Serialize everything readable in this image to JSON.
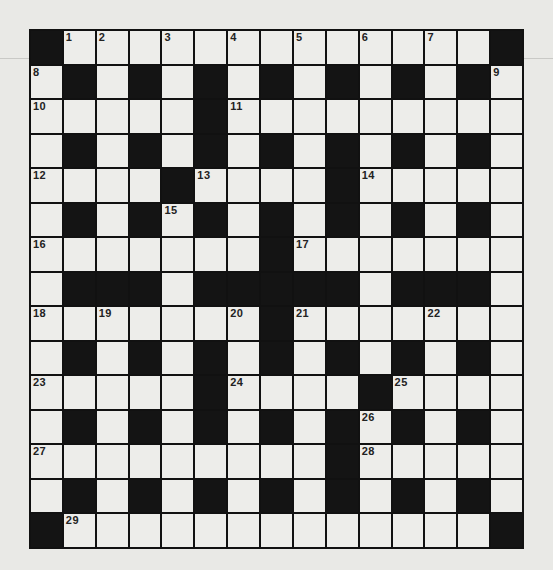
{
  "puzzle": {
    "type": "crossword",
    "rows": 15,
    "cols": 15,
    "grid": [
      "#.............#",
      ".#.#.#.#.#.#.#.",
      ".....#.........",
      ".#.#.#.#.#.#.#.",
      "....#....#.....",
      ".#.#.#.#.#.#.#.",
      ".......#.......",
      ".###.#####.###.",
      ".......#.......",
      ".#.#.#.#.#.#.#.",
      ".....#....#....",
      ".#.#.#.#.#.#.#.",
      ".........#.....",
      ".#.#.#.#.#.#.#.",
      "#.............#"
    ],
    "numbers": [
      {
        "row": 0,
        "col": 1,
        "n": "1"
      },
      {
        "row": 0,
        "col": 2,
        "n": "2"
      },
      {
        "row": 0,
        "col": 4,
        "n": "3"
      },
      {
        "row": 0,
        "col": 6,
        "n": "4"
      },
      {
        "row": 0,
        "col": 8,
        "n": "5"
      },
      {
        "row": 0,
        "col": 10,
        "n": "6"
      },
      {
        "row": 0,
        "col": 12,
        "n": "7"
      },
      {
        "row": 1,
        "col": 0,
        "n": "8"
      },
      {
        "row": 1,
        "col": 14,
        "n": "9"
      },
      {
        "row": 2,
        "col": 0,
        "n": "10"
      },
      {
        "row": 2,
        "col": 6,
        "n": "11"
      },
      {
        "row": 4,
        "col": 0,
        "n": "12"
      },
      {
        "row": 4,
        "col": 5,
        "n": "13"
      },
      {
        "row": 4,
        "col": 10,
        "n": "14"
      },
      {
        "row": 5,
        "col": 4,
        "n": "15"
      },
      {
        "row": 6,
        "col": 0,
        "n": "16"
      },
      {
        "row": 6,
        "col": 8,
        "n": "17"
      },
      {
        "row": 8,
        "col": 0,
        "n": "18"
      },
      {
        "row": 8,
        "col": 2,
        "n": "19"
      },
      {
        "row": 8,
        "col": 6,
        "n": "20"
      },
      {
        "row": 8,
        "col": 8,
        "n": "21"
      },
      {
        "row": 8,
        "col": 12,
        "n": "22"
      },
      {
        "row": 10,
        "col": 0,
        "n": "23"
      },
      {
        "row": 10,
        "col": 6,
        "n": "24"
      },
      {
        "row": 10,
        "col": 11,
        "n": "25"
      },
      {
        "row": 11,
        "col": 10,
        "n": "26"
      },
      {
        "row": 12,
        "col": 0,
        "n": "27"
      },
      {
        "row": 12,
        "col": 10,
        "n": "28"
      },
      {
        "row": 14,
        "col": 1,
        "n": "29"
      }
    ]
  },
  "colors": {
    "paper": "#e9e9e6",
    "cell": "#ededea",
    "block": "#141414"
  }
}
